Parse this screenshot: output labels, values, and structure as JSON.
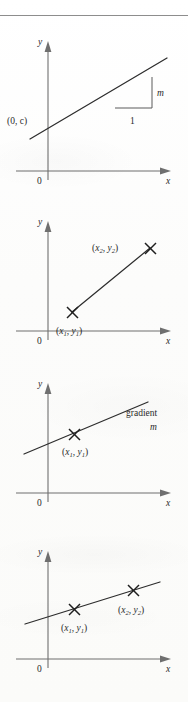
{
  "page": {
    "kind": "textbook-figure-column",
    "rule_top": true,
    "background_color": "#fdfdfc",
    "ink_color": "#2a2a2a",
    "axis_color": "#6f6f6f"
  },
  "figures": [
    {
      "id": "fig-intercept-gradient",
      "caption": "",
      "axes": {
        "y_label": "y",
        "x_label": "x",
        "origin_label": "0"
      },
      "labels": {
        "intercept": "(0, c)",
        "rise": "m",
        "run": "1"
      }
    },
    {
      "id": "fig-two-points",
      "axes": {
        "y_label": "y",
        "x_label": "x",
        "origin_label": "0"
      },
      "labels": {
        "point2_open": "(",
        "point2_x": "x",
        "point2_xsub": "2",
        "point2_sep": ", ",
        "point2_y": "y",
        "point2_ysub": "2",
        "point2_close": ")",
        "point1_open": "(",
        "point1_x": "x",
        "point1_xsub": "1",
        "point1_sep": ", ",
        "point1_y": "y",
        "point1_ysub": "1",
        "point1_close": ")"
      }
    },
    {
      "id": "fig-gradient-through-point",
      "axes": {
        "y_label": "y",
        "x_label": "x",
        "origin_label": "0"
      },
      "labels": {
        "gradient_word": "gradient",
        "gradient_symbol": "m",
        "point1_open": "(",
        "point1_x": "x",
        "point1_xsub": "1",
        "point1_sep": ", ",
        "point1_y": "y",
        "point1_ysub": "1",
        "point1_close": ")"
      }
    },
    {
      "id": "fig-line-through-two-points",
      "axes": {
        "y_label": "y",
        "x_label": "x",
        "origin_label": "0"
      },
      "labels": {
        "point1_open": "(",
        "point1_x": "x",
        "point1_xsub": "1",
        "point1_sep": ", ",
        "point1_y": "y",
        "point1_ysub": "1",
        "point1_close": ")",
        "point2_open": "(",
        "point2_x": "x",
        "point2_xsub": "2",
        "point2_sep": ", ",
        "point2_y": "y",
        "point2_ysub": "2",
        "point2_close": ")"
      }
    }
  ]
}
